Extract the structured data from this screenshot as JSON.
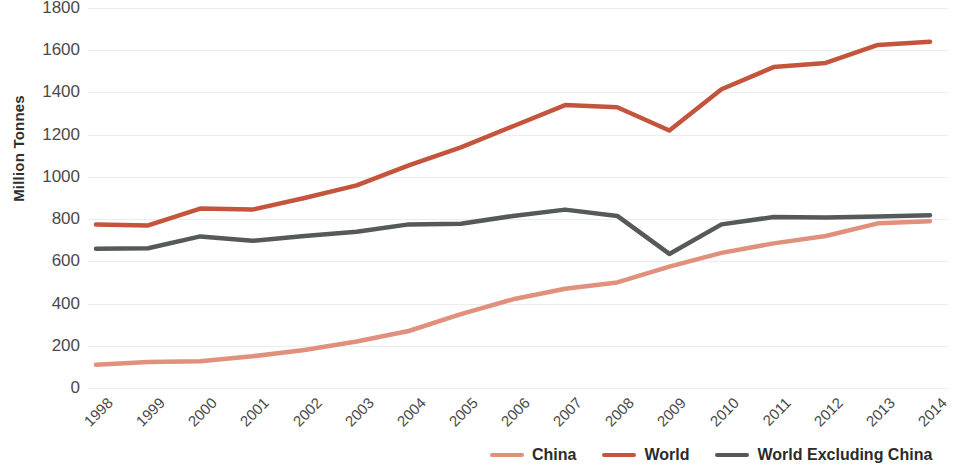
{
  "chart_data": {
    "type": "line",
    "title": "",
    "xlabel": "",
    "ylabel": "Million Tonnes",
    "categories": [
      "1998",
      "1999",
      "2000",
      "2001",
      "2002",
      "2003",
      "2004",
      "2005",
      "2006",
      "2007",
      "2008",
      "2009",
      "2010",
      "2011",
      "2012",
      "2013",
      "2014"
    ],
    "x": [
      1998,
      1999,
      2000,
      2001,
      2002,
      2003,
      2004,
      2005,
      2006,
      2007,
      2008,
      2009,
      2010,
      2011,
      2012,
      2013,
      2014
    ],
    "ylim": [
      0,
      1800
    ],
    "yticks": [
      0,
      200,
      400,
      600,
      800,
      1000,
      1200,
      1400,
      1600,
      1800
    ],
    "grid": true,
    "legend_position": "bottom-right",
    "series": [
      {
        "name": "China",
        "color": "#e0907c",
        "values": [
          110,
          123,
          127,
          150,
          180,
          220,
          270,
          350,
          420,
          470,
          500,
          575,
          640,
          685,
          720,
          780,
          790
        ]
      },
      {
        "name": "World",
        "color": "#c4553c",
        "values": [
          775,
          770,
          850,
          845,
          900,
          960,
          1055,
          1140,
          1240,
          1340,
          1330,
          1220,
          1415,
          1520,
          1540,
          1625,
          1640
        ]
      },
      {
        "name": "World Excluding China",
        "color": "#55595a",
        "values": [
          660,
          662,
          718,
          697,
          720,
          740,
          775,
          778,
          815,
          845,
          815,
          635,
          775,
          810,
          808,
          812,
          818
        ]
      }
    ]
  },
  "axis": {
    "y_title": "Million Tonnes",
    "y_tick_labels": [
      "1800",
      "1600",
      "1400",
      "1200",
      "1000",
      "800",
      "600",
      "400",
      "200",
      "0"
    ],
    "x_tick_labels": [
      "1998",
      "1999",
      "2000",
      "2001",
      "2002",
      "2003",
      "2004",
      "2005",
      "2006",
      "2007",
      "2008",
      "2009",
      "2010",
      "2011",
      "2012",
      "2013",
      "2014"
    ]
  },
  "legend": {
    "items": [
      {
        "label": "China",
        "color": "#e0907c"
      },
      {
        "label": "World",
        "color": "#c4553c"
      },
      {
        "label": "World Excluding China",
        "color": "#55595a"
      }
    ]
  },
  "colors": {
    "grid": "#ededed",
    "text": "#4a4a4a",
    "background": "#ffffff"
  }
}
